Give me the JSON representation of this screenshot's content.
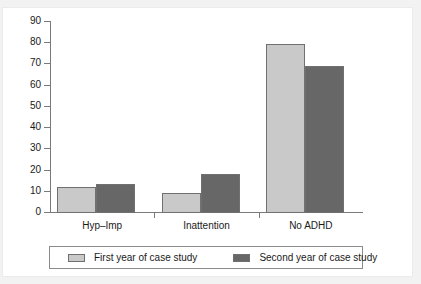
{
  "figure": {
    "background_color": "#ffffff",
    "scan_background_color": "#f2f2f2"
  },
  "chart_data": {
    "type": "bar",
    "title": "",
    "subtitle": "",
    "xlabel": "",
    "ylabel": "",
    "categories": [
      "Hyp–Imp",
      "Inattention",
      "No ADHD"
    ],
    "series": [
      {
        "name": "First year of case study",
        "color": "#c9c9c9",
        "values": [
          12,
          9,
          79
        ]
      },
      {
        "name": "Second year of case study",
        "color": "#676767",
        "values": [
          13,
          18,
          69
        ]
      }
    ],
    "ylim": [
      0,
      90
    ],
    "ytick_step": 10,
    "yticks": [
      "90",
      "80",
      "70",
      "60",
      "50",
      "40",
      "30",
      "20",
      "10",
      "0"
    ],
    "ytick_values": [
      90,
      80,
      70,
      60,
      50,
      40,
      30,
      20,
      10,
      0
    ],
    "grid": false,
    "legend_position": "bottom",
    "axis_style": "open-left-bottom",
    "axis_color": "#7a7a7a",
    "bar_border_color": "#707070",
    "text_color": "#1a1a1a"
  }
}
